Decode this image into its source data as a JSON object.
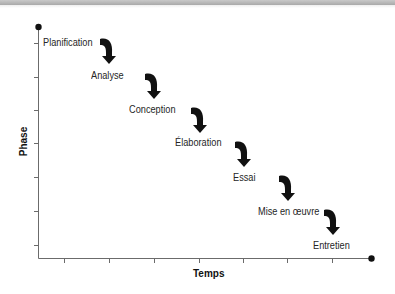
{
  "diagram": {
    "type": "waterfall-process",
    "axes": {
      "y_label": "Phase",
      "x_label": "Temps",
      "y_ticks": 7,
      "x_ticks": 7
    },
    "phases": [
      {
        "label": "Planification"
      },
      {
        "label": "Analyse"
      },
      {
        "label": "Conception"
      },
      {
        "label": "Élaboration"
      },
      {
        "label": "Essai"
      },
      {
        "label": "Mise en œuvre"
      },
      {
        "label": "Entretien"
      }
    ],
    "colors": {
      "axis": "#6b6b6b",
      "arrow": "#111111",
      "text": "#262626",
      "topbar": "#b3b3b3"
    }
  }
}
